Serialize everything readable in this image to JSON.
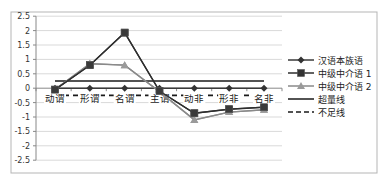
{
  "chart_data": {
    "type": "line",
    "title": "",
    "xlabel": "",
    "ylabel": "",
    "ylim": [
      -2.5,
      2.5
    ],
    "yticks": [
      2.5,
      2,
      1.5,
      1,
      0.5,
      0,
      -0.5,
      -1,
      -1.5,
      -2,
      -2.5
    ],
    "ytick_labels": [
      "2.5",
      "2",
      "1.5",
      "1",
      "0.5",
      "0",
      "-0.5",
      "-1",
      "-1.5",
      "-2",
      "-2.5"
    ],
    "grid": true,
    "legend_position": "right",
    "categories": [
      "动谓",
      "形谓",
      "名谓",
      "主谓",
      "动非",
      "形非",
      "名非"
    ],
    "series": [
      {
        "name": "汉语本族语",
        "marker": "diamond",
        "color": "#3a3a3a",
        "dash": "solid",
        "values": [
          0,
          0,
          0,
          0,
          0,
          0,
          0
        ]
      },
      {
        "name": "中级中介语 1",
        "marker": "square",
        "color": "#2e2e2e",
        "dash": "solid",
        "values": [
          -0.05,
          0.8,
          1.93,
          -0.1,
          -0.87,
          -0.73,
          -0.66
        ]
      },
      {
        "name": "中级中介语 2",
        "marker": "triangle",
        "color": "#8a8a8a",
        "dash": "solid",
        "values": [
          -0.05,
          0.85,
          0.8,
          -0.12,
          -1.1,
          -0.83,
          -0.75
        ]
      },
      {
        "name": "超量线",
        "marker": "none",
        "color": "#1a1a1a",
        "dash": "solid",
        "values": [
          0.25,
          0.25,
          0.25,
          0.25,
          0.25,
          0.25,
          0.25
        ]
      },
      {
        "name": "不足线",
        "marker": "none",
        "color": "#1a1a1a",
        "dash": "dashed",
        "values": [
          -0.25,
          -0.25,
          -0.25,
          -0.25,
          -0.25,
          -0.25,
          -0.25
        ]
      }
    ]
  }
}
